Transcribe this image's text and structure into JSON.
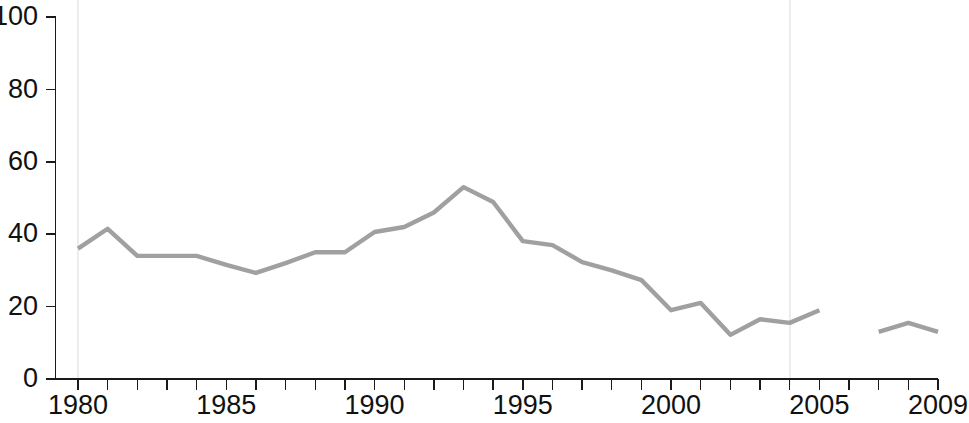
{
  "chart_data": {
    "type": "line",
    "title": "",
    "subtitle": "",
    "xlabel": "",
    "ylabel": "",
    "xlim": [
      1979.4,
      2009.4
    ],
    "ylim": [
      0,
      100
    ],
    "grid": "faint vertical gridlines at 1980 and 2004",
    "legend": "none",
    "line_color": "#a0a0a0",
    "axis_color": "#1a1a1a",
    "gridline_color": "#ececec",
    "x": [
      1980,
      1981,
      1982,
      1983,
      1984,
      1985,
      1986,
      1987,
      1988,
      1989,
      1990,
      1991,
      1992,
      1993,
      1994,
      1995,
      1996,
      1997,
      1998,
      1999,
      2000,
      2001,
      2002,
      2003,
      2004,
      2005,
      2007,
      2008,
      2009
    ],
    "values": [
      36,
      41.5,
      34,
      34,
      34,
      31.5,
      29.3,
      32,
      35,
      35,
      40.6,
      42,
      46,
      53,
      48.9,
      38.1,
      37,
      32.3,
      30,
      27.3,
      19,
      21,
      12.2,
      16.5,
      15.5,
      19,
      13,
      15.5,
      13
    ],
    "series": [
      {
        "name": "series-1",
        "segments": [
          {
            "x": [
              1980,
              1981,
              1982,
              1983,
              1984,
              1985,
              1986,
              1987,
              1988,
              1989,
              1990,
              1991,
              1992,
              1993,
              1994,
              1995,
              1996,
              1997,
              1998,
              1999,
              2000,
              2001,
              2002,
              2003,
              2004,
              2005
            ],
            "values": [
              36,
              41.5,
              34,
              34,
              34,
              31.5,
              29.3,
              32,
              35,
              35,
              40.6,
              42,
              46,
              53,
              48.9,
              38.1,
              37,
              32.3,
              30,
              27.3,
              19,
              21,
              12.2,
              16.5,
              15.5,
              19
            ]
          },
          {
            "x": [
              2007,
              2008,
              2009
            ],
            "values": [
              13,
              15.5,
              13
            ]
          }
        ]
      }
    ],
    "y_ticks": [
      0,
      20,
      40,
      60,
      80,
      100
    ],
    "y_tick_labels": [
      "0",
      "20",
      "40",
      "60",
      "80",
      "100"
    ],
    "x_ticks": [
      1980,
      1981,
      1982,
      1983,
      1984,
      1985,
      1986,
      1987,
      1988,
      1989,
      1990,
      1991,
      1992,
      1993,
      1994,
      1995,
      1996,
      1997,
      1998,
      1999,
      2000,
      2001,
      2002,
      2003,
      2004,
      2005,
      2006,
      2007,
      2008,
      2009
    ],
    "x_tick_labels": [
      {
        "x": 1980,
        "label": "1980"
      },
      {
        "x": 1985,
        "label": "1985"
      },
      {
        "x": 1990,
        "label": "1990"
      },
      {
        "x": 1995,
        "label": "1995"
      },
      {
        "x": 2000,
        "label": "2000"
      },
      {
        "x": 2005,
        "label": "2005"
      },
      {
        "x": 2009,
        "label": "2009"
      }
    ],
    "vertical_gridlines": [
      1980,
      2004
    ],
    "annotations": []
  }
}
